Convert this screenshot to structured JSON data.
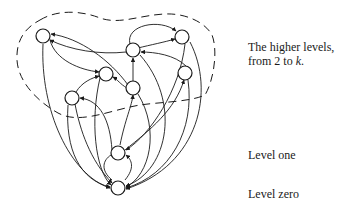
{
  "diagram": {
    "labels": {
      "higher_line1": "The higher levels,",
      "higher_line2_prefix": "from 2 to ",
      "higher_line2_var": "k",
      "higher_line2_suffix": ".",
      "level_one": "Level one",
      "level_zero": "Level zero"
    },
    "colors": {
      "stroke": "#1a1a1a",
      "background": "#ffffff"
    },
    "nodes": [
      {
        "id": "A",
        "x": 43,
        "y": 36,
        "level": "higher"
      },
      {
        "id": "B",
        "x": 133,
        "y": 50,
        "level": "higher"
      },
      {
        "id": "C",
        "x": 182,
        "y": 37,
        "level": "higher"
      },
      {
        "id": "D",
        "x": 106,
        "y": 74,
        "level": "higher"
      },
      {
        "id": "E",
        "x": 185,
        "y": 73,
        "level": "higher"
      },
      {
        "id": "F",
        "x": 72,
        "y": 98,
        "level": "higher"
      },
      {
        "id": "G",
        "x": 133,
        "y": 88,
        "level": "higher"
      },
      {
        "id": "H",
        "x": 118,
        "y": 153,
        "level": "one"
      },
      {
        "id": "I",
        "x": 118,
        "y": 188,
        "level": "zero"
      }
    ]
  }
}
